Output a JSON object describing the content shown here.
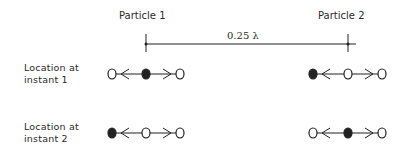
{
  "particles": [
    {
      "label": "Particle 1",
      "x": 146
    },
    {
      "label": "Particle 2",
      "x": 348
    }
  ],
  "distance": {
    "label": "0.25 λ",
    "y": 44
  },
  "rows": [
    {
      "label_line1": "Location at",
      "label_line2": "instant 1",
      "y": 74,
      "groups": [
        {
          "particle": "Particle 1",
          "dots": [
            {
              "x": 112,
              "filled": false
            },
            {
              "x": 146,
              "filled": true
            },
            {
              "x": 180,
              "filled": false
            }
          ]
        },
        {
          "particle": "Particle 2",
          "dots": [
            {
              "x": 313,
              "filled": true
            },
            {
              "x": 348,
              "filled": false
            },
            {
              "x": 382,
              "filled": false
            }
          ]
        }
      ]
    },
    {
      "label_line1": "Location at",
      "label_line2": "instant 2",
      "y": 133,
      "groups": [
        {
          "particle": "Particle 1",
          "dots": [
            {
              "x": 112,
              "filled": true
            },
            {
              "x": 146,
              "filled": false
            },
            {
              "x": 180,
              "filled": false
            }
          ]
        },
        {
          "particle": "Particle 2",
          "dots": [
            {
              "x": 313,
              "filled": false
            },
            {
              "x": 348,
              "filled": true
            },
            {
              "x": 382,
              "filled": false
            }
          ]
        }
      ]
    }
  ],
  "colors": {
    "ink": "#222222",
    "background": "#ffffff"
  }
}
